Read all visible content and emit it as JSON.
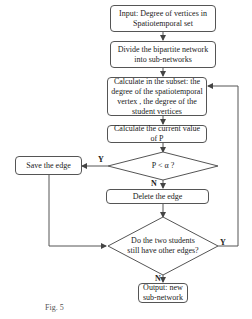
{
  "flowchart": {
    "input": "Input: Degree of vertices in Spatiotemporal set",
    "divide": "Divide the bipartite network into sub-networks",
    "calc_degree": "Calculate in the subset: the degree of the spatiotemporal vertex , the degree of the student vertices",
    "calc_p": "Calculate the current value of P",
    "decision1": "P < α ?",
    "save_edge": "Save the edge",
    "delete_edge": "Delete the edge",
    "decision2": "Do the two students still have other edges?",
    "output": "Output: new sub-network",
    "labels": {
      "y1": "Y",
      "n1": "N",
      "y2": "Y",
      "n2": "N"
    }
  },
  "caption": "Fig. 5"
}
